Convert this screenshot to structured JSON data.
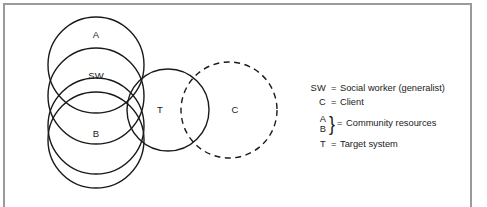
{
  "figure": {
    "type": "venn-diagram",
    "background_color": "#ffffff",
    "frame_color": "#9a9a9a",
    "stroke_color": "#1a1a1a"
  },
  "diagram": {
    "circles": [
      {
        "id": "A",
        "label": "A",
        "style": "solid",
        "cx": 96,
        "cy": 65,
        "r": 48,
        "label_x": 96,
        "label_y": 38
      },
      {
        "id": "SW",
        "label": "SW",
        "style": "solid",
        "cx": 96,
        "cy": 96,
        "r": 48,
        "label_x": 96,
        "label_y": 79
      },
      {
        "id": "B",
        "label": "B",
        "style": "solid",
        "cx": 96,
        "cy": 126,
        "r": 48,
        "label_x": 96,
        "label_y": 137
      },
      {
        "id": "D",
        "label": "",
        "style": "solid",
        "cx": 96,
        "cy": 140,
        "r": 48,
        "label_x": 0,
        "label_y": 0
      },
      {
        "id": "T",
        "label": "T",
        "style": "solid",
        "cx": 168,
        "cy": 110,
        "r": 41,
        "label_x": 160,
        "label_y": 113
      },
      {
        "id": "C",
        "label": "C",
        "style": "dashed",
        "cx": 229,
        "cy": 110,
        "r": 48,
        "label_x": 235,
        "label_y": 113
      }
    ]
  },
  "legend": {
    "entries": [
      {
        "symbol": "SW",
        "equals": "=",
        "description": "Social worker (generalist)"
      },
      {
        "symbol": "C",
        "equals": "=",
        "description": "Client"
      }
    ],
    "grouped_entry": {
      "symbol_top": "A",
      "symbol_bottom": "B",
      "brace": "}",
      "equals": "=",
      "description": "Community resources"
    },
    "last_entry": {
      "symbol": "T",
      "equals": "=",
      "description": "Target system"
    }
  }
}
